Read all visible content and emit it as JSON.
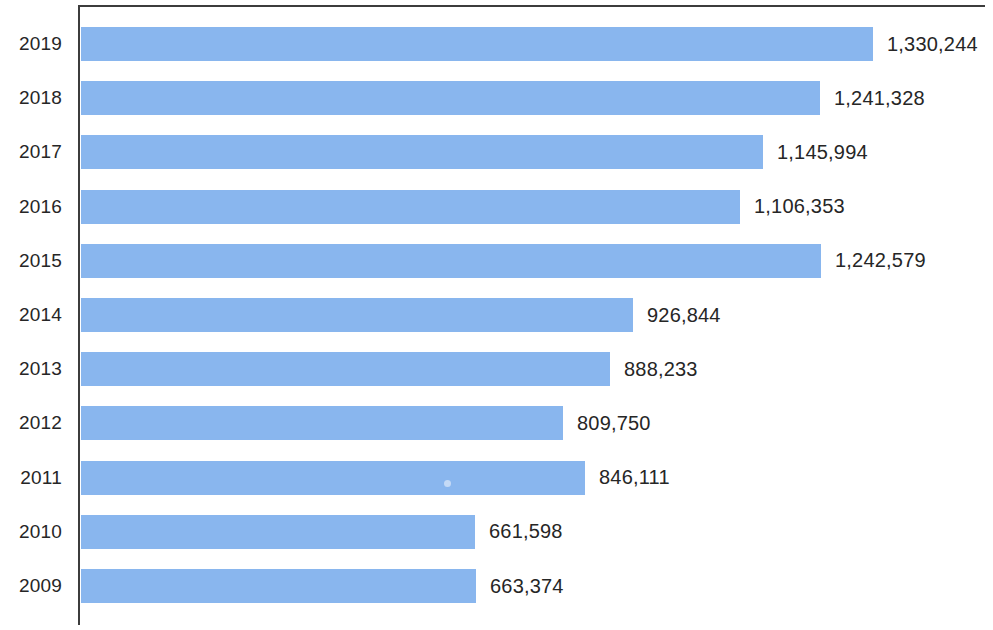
{
  "chart_data": {
    "type": "bar",
    "orientation": "horizontal",
    "title": "",
    "subtitle": "",
    "xlabel": "",
    "ylabel": "",
    "categories": [
      "2019",
      "2018",
      "2017",
      "2016",
      "2015",
      "2014",
      "2013",
      "2012",
      "2011",
      "2010",
      "2009"
    ],
    "values": [
      1330244,
      1241328,
      1145994,
      1106353,
      1242579,
      926844,
      888233,
      809750,
      846111,
      661598,
      663374
    ],
    "value_labels": [
      "1,330,244",
      "1,241,328",
      "1,145,994",
      "1,106,353",
      "1,242,579",
      "926,844",
      "888,233",
      "809,750",
      "846,111",
      "661,598",
      "663,374"
    ],
    "series": [
      {
        "name": "",
        "values": [
          1330244,
          1241328,
          1145994,
          1106353,
          1242579,
          926844,
          888233,
          809750,
          846111,
          661598,
          663374
        ]
      }
    ],
    "xlim": [
      0,
      1330244
    ],
    "tick_labels": [],
    "grid": false,
    "legend": null,
    "bar_color": "#89b6ee",
    "axis_color": "#3c3c3c",
    "text_color": "#262626"
  },
  "axis": {
    "y_tick_labels": [
      "2019",
      "2018",
      "2017",
      "2016",
      "2015",
      "2014",
      "2013",
      "2012",
      "2011",
      "2010",
      "2009"
    ]
  }
}
